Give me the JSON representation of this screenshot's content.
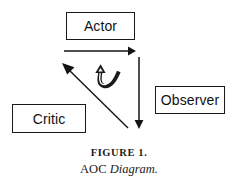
{
  "figure": {
    "caption_label": "FIGURE 1.",
    "caption_title_plain": "AOC ",
    "caption_title_italic": "Diagram.",
    "background_color": "#ffffff",
    "ink_color": "#1a1a1a"
  },
  "nodes": [
    {
      "id": "actor",
      "label": "Actor"
    },
    {
      "id": "observer",
      "label": "Observer"
    },
    {
      "id": "critic",
      "label": "Critic"
    }
  ],
  "arrows": [
    {
      "id": "actor-to-observer",
      "name": "horizontal-right-arrow",
      "direction": "right"
    },
    {
      "id": "observer-down",
      "name": "vertical-down-arrow",
      "direction": "down"
    },
    {
      "id": "to-actor-diagonal",
      "name": "diagonal-up-left-arrow",
      "direction": "up-left"
    },
    {
      "id": "feedback-loop",
      "name": "curved-loop-arrow",
      "direction": "loop"
    }
  ]
}
